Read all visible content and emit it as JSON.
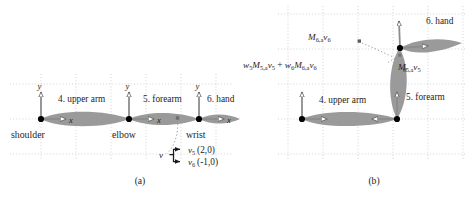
{
  "figure": {
    "type": "technical-diagram",
    "background_color": "#ffffff",
    "bone_color": "#999999",
    "grid_color": "#c8c8c8",
    "joint_color": "#000000",
    "axis_color": "#808080",
    "grid_spacing": "35"
  },
  "panel_a": {
    "caption": "(a)",
    "bones": [
      {
        "index": "4",
        "label": "4. upper arm"
      },
      {
        "index": "5",
        "label": "5. forearm"
      },
      {
        "index": "6",
        "label": "6. hand"
      }
    ],
    "joints": [
      {
        "label": "shoulder"
      },
      {
        "label": "elbow"
      },
      {
        "label": "wrist"
      }
    ],
    "axes": [
      {
        "y_label": "y",
        "x_label": "x"
      },
      {
        "y_label": "y",
        "x_label": "x"
      },
      {
        "y_label": "y",
        "x_label": "x"
      }
    ],
    "vertex": {
      "marker_label": "v",
      "bindings": [
        {
          "name": "v",
          "sub": "5",
          "coords": "(2,0)"
        },
        {
          "name": "v",
          "sub": "6",
          "coords": "(-1,0)"
        }
      ]
    }
  },
  "panel_b": {
    "caption": "(b)",
    "bones": [
      {
        "index": "4",
        "label": "4. upper arm"
      },
      {
        "index": "5",
        "label": "5. forearm"
      },
      {
        "index": "6",
        "label": "6. hand"
      }
    ],
    "annotations": [
      {
        "id": "m6v6",
        "parts": [
          {
            "t": "M",
            "k": "it"
          },
          {
            "t": "6,a",
            "k": "sub"
          },
          {
            "t": "v",
            "k": "it"
          },
          {
            "t": "6",
            "k": "sub"
          }
        ],
        "plain": "M6,a v6"
      },
      {
        "id": "blend",
        "parts": [
          {
            "t": "w",
            "k": "it"
          },
          {
            "t": "5",
            "k": "sub"
          },
          {
            "t": "M",
            "k": "it"
          },
          {
            "t": "5,a",
            "k": "sub"
          },
          {
            "t": "v",
            "k": "it"
          },
          {
            "t": "5",
            "k": "sub"
          },
          {
            "t": " + ",
            "k": "op"
          },
          {
            "t": "w",
            "k": "it"
          },
          {
            "t": "6",
            "k": "sub"
          },
          {
            "t": "M",
            "k": "it"
          },
          {
            "t": "6,a",
            "k": "sub"
          },
          {
            "t": "v",
            "k": "it"
          },
          {
            "t": "6",
            "k": "sub"
          }
        ],
        "plain": "w5 M5,a v5 + w6 M6,a v6"
      },
      {
        "id": "m5v5",
        "parts": [
          {
            "t": "M",
            "k": "it"
          },
          {
            "t": "5,a",
            "k": "sub"
          },
          {
            "t": "v",
            "k": "it"
          },
          {
            "t": "5",
            "k": "sub"
          }
        ],
        "plain": "M5,a v5"
      }
    ]
  }
}
